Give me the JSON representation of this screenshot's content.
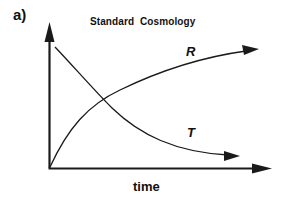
{
  "figure": {
    "panel_label": "a)",
    "title": "Standard  Cosmology",
    "x_axis_label": "time",
    "curves": [
      {
        "name": "R",
        "label": "R",
        "description": "increasing, concave-down curve from origin"
      },
      {
        "name": "T",
        "label": "T",
        "description": "decreasing, convex curve from top-left"
      }
    ],
    "colors": {
      "line": "#1a1a1a",
      "background": "#ffffff"
    }
  }
}
